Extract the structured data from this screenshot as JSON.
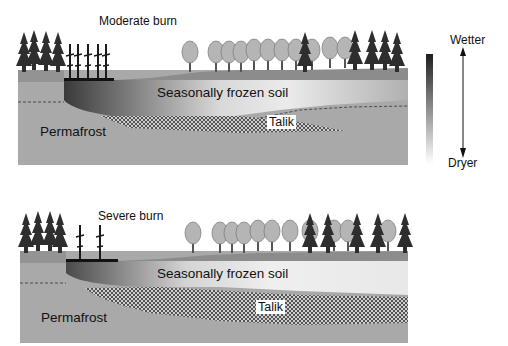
{
  "panels": [
    {
      "title": "Moderate burn",
      "layers": {
        "frozen_soil": "Seasonally frozen soil",
        "talik": "Talik",
        "permafrost": "Permafrost"
      }
    },
    {
      "title": "Severe burn",
      "layers": {
        "frozen_soil": "Seasonally frozen soil",
        "talik": "Talik",
        "permafrost": "Permafrost"
      }
    }
  ],
  "legend": {
    "top_label": "Wetter",
    "bottom_label": "Dryer",
    "gradient_top": "#222222",
    "gradient_bottom": "#ffffff"
  },
  "colors": {
    "permafrost": "#a9a9a9",
    "ground": "#8c8c8c",
    "conifer": "#2e2e2e",
    "deciduous": "#b4b4b4"
  }
}
